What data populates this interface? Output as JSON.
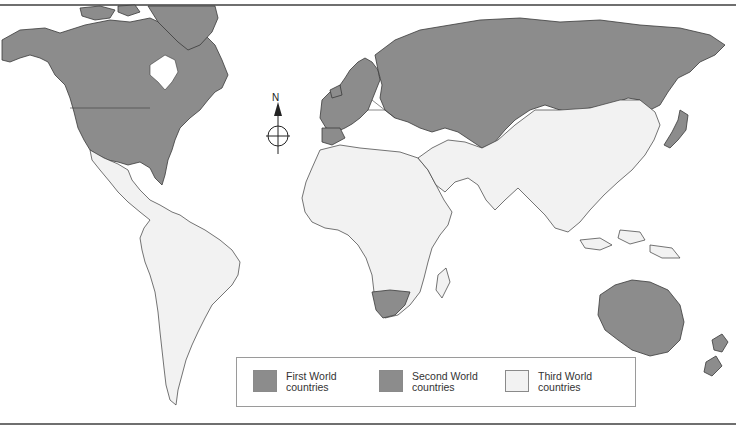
{
  "map": {
    "title": "",
    "compass": {
      "label": "N"
    },
    "colors": {
      "first_world": "#8c8c8c",
      "second_world": "#8c8c8c",
      "third_world": "#f2f2f2",
      "ocean": "#ffffff",
      "border": "#3a3a3a"
    },
    "regions": {
      "first_world": [
        "North America (USA, Canada)",
        "Greenland",
        "Western Europe",
        "Japan",
        "Australia",
        "New Zealand",
        "South Africa",
        "Israel"
      ],
      "second_world": [
        "Soviet Union",
        "Eastern Europe"
      ],
      "third_world": [
        "Latin America",
        "Africa",
        "Middle East",
        "South Asia",
        "China",
        "Southeast Asia"
      ]
    }
  },
  "legend": {
    "items": [
      {
        "label": "First World\ncountries",
        "color": "#8c8c8c"
      },
      {
        "label": "Second World\ncountries",
        "color": "#8c8c8c"
      },
      {
        "label": "Third World\ncountries",
        "color": "#f2f2f2"
      }
    ]
  }
}
